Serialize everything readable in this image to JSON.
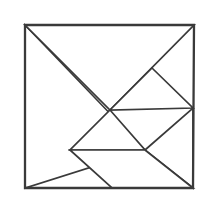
{
  "figure": {
    "background_color": "#ffffff",
    "line_color": "#3a3a3a",
    "frame_line_width": 2.3,
    "piece_line_width": 1.7
  },
  "chart_data": {
    "type": "diagram",
    "xlabel": "",
    "ylabel": "",
    "xlim": [
      0,
      215
    ],
    "ylim": [
      0,
      209
    ],
    "grid": false,
    "legend": "none",
    "square_frame": {
      "top_left": [
        25,
        25
      ],
      "top_right": [
        194,
        25
      ],
      "bottom_right": [
        193,
        188
      ],
      "bottom_left": [
        25,
        188
      ]
    },
    "vertices": {
      "A_top_left": [
        25,
        25
      ],
      "B_top_right": [
        194,
        25
      ],
      "C_bottom_right": [
        193,
        188
      ],
      "D_bottom_left": [
        25,
        188
      ],
      "E_center": [
        110,
        110
      ],
      "F_upper_right_mid": [
        152,
        68
      ],
      "G_right_edge_mid": [
        193,
        108
      ],
      "H_horizontal_left": [
        70,
        150
      ],
      "I_horizontal_right": [
        145,
        150
      ],
      "J_bottom_edge_mid": [
        112,
        188
      ]
    },
    "segments": [
      {
        "name": "top-edge",
        "from": [
          25,
          25
        ],
        "to": [
          194,
          25
        ]
      },
      {
        "name": "right-edge",
        "from": [
          194,
          25
        ],
        "to": [
          193,
          188
        ]
      },
      {
        "name": "bottom-edge",
        "from": [
          193,
          188
        ],
        "to": [
          25,
          188
        ]
      },
      {
        "name": "left-edge",
        "from": [
          25,
          188
        ],
        "to": [
          25,
          25
        ]
      },
      {
        "name": "main-diagonal-top-left-to-bottom-right",
        "from": [
          25,
          25
        ],
        "to": [
          145,
          150
        ]
      },
      {
        "name": "anti-diagonal-bottom-left-to-top-right",
        "from": [
          25,
          188
        ],
        "to": [
          194,
          25
        ]
      },
      {
        "name": "small-square-upper-right-side",
        "from": [
          152,
          68
        ],
        "to": [
          193,
          108
        ]
      },
      {
        "name": "small-square-lower-left-side",
        "from": [
          110,
          110
        ],
        "to": [
          145,
          150
        ]
      },
      {
        "name": "horizontal-divider",
        "from": [
          70,
          150
        ],
        "to": [
          145,
          150
        ]
      },
      {
        "name": "lower-right-diagonal",
        "from": [
          112,
          188
        ],
        "to": [
          193,
          108
        ]
      }
    ],
    "pieces": [
      {
        "name": "large-triangle-upper-left",
        "shape": "right triangle",
        "points": "25,25 145,150 25,188"
      },
      {
        "name": "large-triangle-top",
        "shape": "right triangle",
        "points": "25,25 194,25 110,110"
      },
      {
        "name": "medium-triangle-right",
        "shape": "right triangle",
        "points": "152,68 193,108 110,110"
      },
      {
        "name": "small-triangle-center",
        "shape": "right triangle",
        "points": "110,110 145,150 70,150"
      },
      {
        "name": "small-triangle-lower-right",
        "shape": "right triangle",
        "points": "145,150 193,108 193,188"
      },
      {
        "name": "parallelogram-bottom",
        "shape": "parallelogram",
        "points": "70,150 145,150 193,188 112,188"
      }
    ],
    "piece_count": 7
  }
}
